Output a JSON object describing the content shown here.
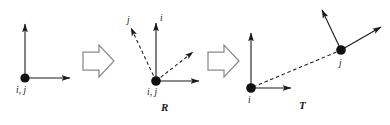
{
  "figure": {
    "type": "diagram",
    "background_color": "#ffffff",
    "stroke_color": "#1a1a1a",
    "node_color": "#111111"
  },
  "panels": [
    {
      "id": "initial",
      "node_label": "i, j",
      "caption": "",
      "vectors": [
        {
          "name": "vertical-axis",
          "style": "solid"
        },
        {
          "name": "horizontal-axis",
          "style": "solid"
        }
      ]
    },
    {
      "id": "rotation",
      "node_label": "i, j",
      "caption": "R",
      "vectors": [
        {
          "name": "vertical-axis",
          "style": "solid",
          "label": ""
        },
        {
          "name": "horizontal-axis",
          "style": "solid",
          "label": ""
        },
        {
          "name": "rotated-j-axis",
          "style": "dashed",
          "label": "j"
        },
        {
          "name": "rotated-i-axis",
          "style": "dashed",
          "label": "i"
        }
      ]
    },
    {
      "id": "translation",
      "caption": "T",
      "node_i_label": "i",
      "node_j_label": "j",
      "vectors": [
        {
          "name": "i-vertical-axis",
          "style": "solid"
        },
        {
          "name": "i-horizontal-axis",
          "style": "solid"
        },
        {
          "name": "translation-link",
          "style": "dashed"
        },
        {
          "name": "j-vertical-axis",
          "style": "solid"
        },
        {
          "name": "j-horizontal-axis",
          "style": "solid"
        }
      ]
    }
  ],
  "transitions": [
    {
      "id": "arrow-1",
      "glyph": "block-arrow-right"
    },
    {
      "id": "arrow-2",
      "glyph": "block-arrow-right"
    }
  ],
  "labels": {
    "panel1_node": "i, j",
    "panel2_node": "i, j",
    "panel2_vec_j": "j",
    "panel2_vec_i": "i",
    "panel2_caption": "R",
    "panel3_node_i": "i",
    "panel3_node_j": "j",
    "panel3_caption": "T"
  }
}
